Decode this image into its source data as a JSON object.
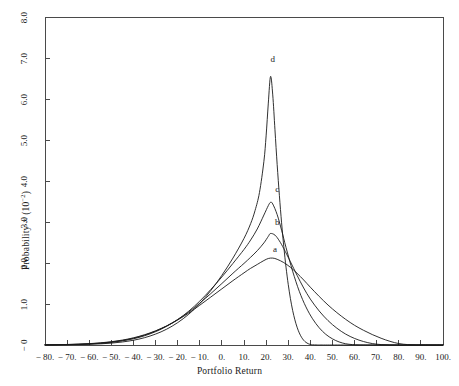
{
  "figure": {
    "background": "#ffffff",
    "line_color": "#1a1a1a",
    "axis_color": "#4a4a4a"
  },
  "chart_data": {
    "type": "line",
    "title": "",
    "xlabel": "Portfolio Return",
    "ylabel": "Probability × (10⁻²)",
    "ylabel_base": "Probability × (10",
    "ylabel_exponent": "−2",
    "ylabel_close": ")",
    "xlim": [
      -80,
      100
    ],
    "ylim": [
      0,
      8.0
    ],
    "grid": false,
    "legend": "inline-curve-labels",
    "x_tick_labels": [
      "− 80.",
      "− 70.",
      "− 60.",
      "− 50.",
      "− 40.",
      "− 30.",
      "− 20.",
      "− 10.",
      "0.",
      "10.",
      "20.",
      "30.",
      "40.",
      "50.",
      "60.",
      "70.",
      "80.",
      "90.",
      "100."
    ],
    "x_tick_values": [
      -80,
      -70,
      -60,
      -50,
      -40,
      -30,
      -20,
      -10,
      0,
      10,
      20,
      30,
      40,
      50,
      60,
      70,
      80,
      90,
      100
    ],
    "y_tick_labels": [
      "− 0",
      "1.0",
      "2.0",
      "3.0",
      "4.0",
      "5.0",
      "6.0",
      "7.0",
      "8.0"
    ],
    "y_tick_values": [
      0,
      1.0,
      2.0,
      3.0,
      4.0,
      5.0,
      6.0,
      7.0,
      8.0
    ],
    "series": [
      {
        "name": "a",
        "label": "a",
        "peak_x": 21,
        "peak_y": 2.12,
        "label_x": 24,
        "label_y": 2.32,
        "points": [
          [
            -80,
            0.005
          ],
          [
            -75,
            0.008
          ],
          [
            -70,
            0.013
          ],
          [
            -65,
            0.021
          ],
          [
            -60,
            0.033
          ],
          [
            -55,
            0.052
          ],
          [
            -50,
            0.08
          ],
          [
            -45,
            0.12
          ],
          [
            -40,
            0.175
          ],
          [
            -35,
            0.25
          ],
          [
            -30,
            0.345
          ],
          [
            -25,
            0.465
          ],
          [
            -20,
            0.61
          ],
          [
            -15,
            0.78
          ],
          [
            -10,
            0.97
          ],
          [
            -5,
            1.17
          ],
          [
            0,
            1.37
          ],
          [
            5,
            1.57
          ],
          [
            10,
            1.76
          ],
          [
            13,
            1.87
          ],
          [
            16,
            1.965
          ],
          [
            19,
            2.06
          ],
          [
            21,
            2.11
          ],
          [
            23,
            2.12
          ],
          [
            25,
            2.09
          ],
          [
            28,
            2.01
          ],
          [
            31,
            1.895
          ],
          [
            34,
            1.75
          ],
          [
            37,
            1.585
          ],
          [
            40,
            1.41
          ],
          [
            44,
            1.185
          ],
          [
            48,
            0.975
          ],
          [
            52,
            0.79
          ],
          [
            56,
            0.625
          ],
          [
            60,
            0.48
          ],
          [
            64,
            0.36
          ],
          [
            68,
            0.255
          ],
          [
            72,
            0.165
          ],
          [
            76,
            0.09
          ],
          [
            80,
            0.035
          ],
          [
            84,
            0.01
          ],
          [
            88,
            0.003
          ],
          [
            92,
            0.001
          ],
          [
            96,
            0.0
          ],
          [
            100,
            0.0
          ]
        ]
      },
      {
        "name": "b",
        "label": "b",
        "peak_x": 22,
        "peak_y": 2.72,
        "label_x": 25,
        "label_y": 2.98,
        "points": [
          [
            -80,
            0.004
          ],
          [
            -75,
            0.007
          ],
          [
            -70,
            0.011
          ],
          [
            -65,
            0.018
          ],
          [
            -60,
            0.029
          ],
          [
            -55,
            0.046
          ],
          [
            -50,
            0.072
          ],
          [
            -45,
            0.11
          ],
          [
            -40,
            0.165
          ],
          [
            -35,
            0.24
          ],
          [
            -30,
            0.34
          ],
          [
            -25,
            0.465
          ],
          [
            -20,
            0.62
          ],
          [
            -15,
            0.805
          ],
          [
            -10,
            1.02
          ],
          [
            -5,
            1.255
          ],
          [
            0,
            1.5
          ],
          [
            5,
            1.75
          ],
          [
            10,
            1.99
          ],
          [
            13,
            2.14
          ],
          [
            16,
            2.3
          ],
          [
            19,
            2.49
          ],
          [
            21,
            2.65
          ],
          [
            22,
            2.72
          ],
          [
            24,
            2.68
          ],
          [
            26,
            2.54
          ],
          [
            28,
            2.35
          ],
          [
            31,
            2.03
          ],
          [
            34,
            1.7
          ],
          [
            37,
            1.39
          ],
          [
            40,
            1.12
          ],
          [
            44,
            0.83
          ],
          [
            48,
            0.595
          ],
          [
            52,
            0.41
          ],
          [
            56,
            0.265
          ],
          [
            60,
            0.16
          ],
          [
            64,
            0.085
          ],
          [
            68,
            0.035
          ],
          [
            72,
            0.01
          ],
          [
            76,
            0.002
          ],
          [
            80,
            0.0
          ],
          [
            86,
            0.0
          ],
          [
            92,
            0.0
          ],
          [
            100,
            0.0
          ]
        ]
      },
      {
        "name": "c",
        "label": "c",
        "peak_x": 22,
        "peak_y": 3.48,
        "label_x": 25,
        "label_y": 3.78,
        "points": [
          [
            -80,
            0.003
          ],
          [
            -75,
            0.005
          ],
          [
            -70,
            0.009
          ],
          [
            -65,
            0.015
          ],
          [
            -60,
            0.025
          ],
          [
            -55,
            0.04
          ],
          [
            -50,
            0.064
          ],
          [
            -45,
            0.1
          ],
          [
            -40,
            0.152
          ],
          [
            -35,
            0.225
          ],
          [
            -30,
            0.325
          ],
          [
            -25,
            0.455
          ],
          [
            -20,
            0.62
          ],
          [
            -15,
            0.825
          ],
          [
            -10,
            1.07
          ],
          [
            -5,
            1.355
          ],
          [
            0,
            1.66
          ],
          [
            5,
            1.99
          ],
          [
            10,
            2.33
          ],
          [
            13,
            2.56
          ],
          [
            16,
            2.83
          ],
          [
            19,
            3.17
          ],
          [
            21,
            3.4
          ],
          [
            22,
            3.48
          ],
          [
            23,
            3.44
          ],
          [
            25,
            3.18
          ],
          [
            27,
            2.8
          ],
          [
            29,
            2.38
          ],
          [
            32,
            1.8
          ],
          [
            35,
            1.31
          ],
          [
            38,
            0.93
          ],
          [
            41,
            0.64
          ],
          [
            44,
            0.42
          ],
          [
            47,
            0.26
          ],
          [
            50,
            0.15
          ],
          [
            53,
            0.075
          ],
          [
            56,
            0.03
          ],
          [
            59,
            0.01
          ],
          [
            62,
            0.002
          ],
          [
            66,
            0.0
          ],
          [
            72,
            0.0
          ],
          [
            80,
            0.0
          ],
          [
            90,
            0.0
          ],
          [
            100,
            0.0
          ]
        ]
      },
      {
        "name": "d",
        "label": "d",
        "peak_x": 22,
        "peak_y": 6.55,
        "label_x": 23,
        "label_y": 6.95,
        "points": [
          [
            -80,
            0.002
          ],
          [
            -75,
            0.003
          ],
          [
            -70,
            0.006
          ],
          [
            -65,
            0.01
          ],
          [
            -60,
            0.017
          ],
          [
            -55,
            0.028
          ],
          [
            -50,
            0.046
          ],
          [
            -45,
            0.074
          ],
          [
            -40,
            0.116
          ],
          [
            -35,
            0.178
          ],
          [
            -30,
            0.266
          ],
          [
            -25,
            0.385
          ],
          [
            -20,
            0.545
          ],
          [
            -15,
            0.75
          ],
          [
            -10,
            1.01
          ],
          [
            -5,
            1.33
          ],
          [
            0,
            1.7
          ],
          [
            5,
            2.12
          ],
          [
            10,
            2.6
          ],
          [
            13,
            2.96
          ],
          [
            15,
            3.28
          ],
          [
            17,
            3.72
          ],
          [
            19,
            4.48
          ],
          [
            20,
            5.1
          ],
          [
            21,
            5.9
          ],
          [
            22,
            6.55
          ],
          [
            23,
            6.1
          ],
          [
            24,
            5.25
          ],
          [
            25,
            4.4
          ],
          [
            26,
            3.65
          ],
          [
            27,
            2.98
          ],
          [
            28,
            2.4
          ],
          [
            29,
            1.9
          ],
          [
            30,
            1.48
          ],
          [
            31,
            1.13
          ],
          [
            32,
            0.845
          ],
          [
            33,
            0.615
          ],
          [
            34,
            0.435
          ],
          [
            35,
            0.295
          ],
          [
            36,
            0.19
          ],
          [
            37,
            0.115
          ],
          [
            38,
            0.065
          ],
          [
            39,
            0.032
          ],
          [
            40,
            0.014
          ],
          [
            41,
            0.005
          ],
          [
            43,
            0.001
          ],
          [
            46,
            0.0
          ],
          [
            55,
            0.0
          ],
          [
            70,
            0.0
          ],
          [
            85,
            0.0
          ],
          [
            100,
            0.0
          ]
        ]
      }
    ]
  },
  "axes_geometry": {
    "left": 45,
    "right": 443,
    "top": 17,
    "bottom": 345
  }
}
